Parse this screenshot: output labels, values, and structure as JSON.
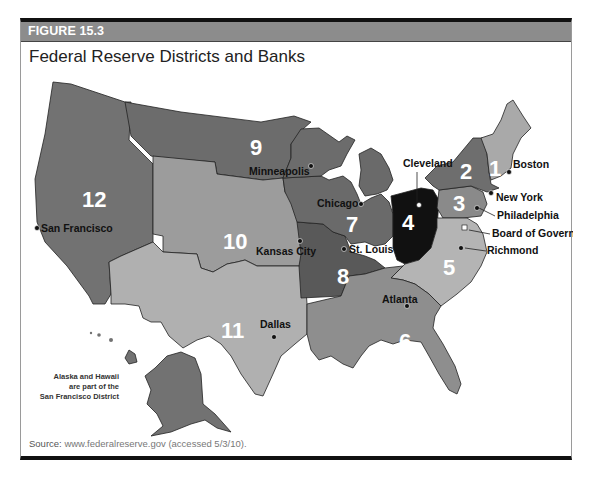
{
  "figure": {
    "label": "FIGURE 15.3",
    "title": "Federal Reserve Districts and Banks",
    "source_prefix": "Source:",
    "source_text": " www.federalreserve.gov (accessed 5/3/10)."
  },
  "note": {
    "line1": "Alaska and Hawaii",
    "line2": "are part of the",
    "line3": "San Francisco District"
  },
  "districts": [
    {
      "number": "1",
      "bank": "Boston",
      "shade": "#a9a9a9"
    },
    {
      "number": "2",
      "bank": "New York",
      "shade": "#6e6e6e"
    },
    {
      "number": "3",
      "bank": "Philadelphia",
      "shade": "#8a8a8a"
    },
    {
      "number": "4",
      "bank": "Cleveland",
      "shade": "#111111"
    },
    {
      "number": "5",
      "bank": "Richmond",
      "shade": "#b4b4b4"
    },
    {
      "number": "6",
      "bank": "Atlanta",
      "shade": "#8e8e8e"
    },
    {
      "number": "7",
      "bank": "Chicago",
      "shade": "#6a6a6a"
    },
    {
      "number": "8",
      "bank": "St. Louis",
      "shade": "#595959"
    },
    {
      "number": "9",
      "bank": "Minneapolis",
      "shade": "#6c6c6c"
    },
    {
      "number": "10",
      "bank": "Kansas City",
      "shade": "#9c9c9c"
    },
    {
      "number": "11",
      "bank": "Dallas",
      "shade": "#b0b0b0"
    },
    {
      "number": "12",
      "bank": "San Francisco",
      "shade": "#727272"
    }
  ],
  "special_labels": {
    "board": "Board of Governors"
  }
}
